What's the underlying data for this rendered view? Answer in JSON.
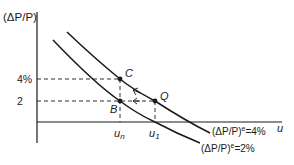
{
  "diagram": {
    "type": "expectations-augmented-phillips-curve",
    "y_axis_label": "(ΔP/P)",
    "x_axis_label": "u",
    "y_ticks": [
      {
        "label": "4%",
        "value": 4
      },
      {
        "label": "2",
        "value": 2
      }
    ],
    "x_ticks": [
      {
        "label": "u",
        "sub": "n"
      },
      {
        "label": "u",
        "sub": "1"
      }
    ],
    "points": [
      {
        "name": "C",
        "x": "u_n",
        "y": "4%"
      },
      {
        "name": "B",
        "x": "u_n",
        "y": "2"
      },
      {
        "name": "Q",
        "x": "u_1",
        "y": "2"
      }
    ],
    "curves": [
      {
        "label": "(ΔP/P)ᵉ=4%",
        "base": "(ΔP/P)",
        "sup": "e",
        "tail": "=4%"
      },
      {
        "label": "(ΔP/P)ᵉ=2%",
        "base": "(ΔP/P)",
        "sup": "e",
        "tail": "=2%"
      }
    ],
    "arrows": [
      "Q → C (along upper curve)",
      "Q → B (horizontal)"
    ],
    "colors": {
      "ink": "#1a1a1a",
      "background": "#ffffff"
    }
  }
}
